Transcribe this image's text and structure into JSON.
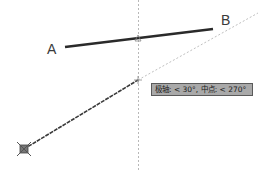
{
  "points": {
    "a_label": "A",
    "b_label": "B"
  },
  "tooltip": {
    "text": "极轴: < 30°, 中点: < 270°"
  },
  "colors": {
    "background": "#ffffff",
    "line": "#2a2a2a",
    "tracking": "#b0b0b0",
    "tooltip_bg": "#a9a9a9",
    "tooltip_border": "#5a5a5a"
  }
}
